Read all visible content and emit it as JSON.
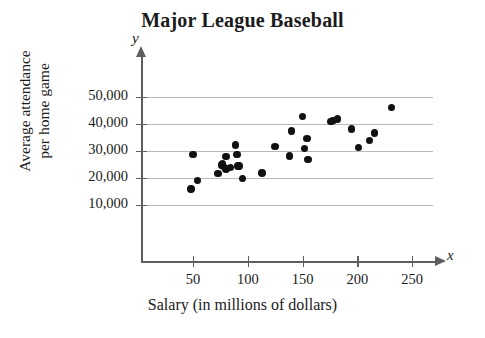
{
  "chart_data": {
    "type": "scatter",
    "title": "Major League Baseball",
    "xlabel": "Salary (in millions of dollars)",
    "ylabel": "Average attendance per home game",
    "ylabel_lines": [
      "Average attendance",
      "per home game"
    ],
    "x_axis_name": "x",
    "y_axis_name": "y",
    "xlim": [
      0,
      270
    ],
    "ylim": [
      0,
      54000
    ],
    "xticks": [
      50,
      100,
      150,
      200,
      250
    ],
    "xtick_labels": [
      "50",
      "100",
      "150",
      "200",
      "250"
    ],
    "yticks": [
      10000,
      20000,
      30000,
      40000,
      50000
    ],
    "ytick_labels": [
      "10,000",
      "20,000",
      "30,000",
      "40,000",
      "50,000"
    ],
    "grid": "horizontal",
    "legend": "none",
    "marker": "filled-circle",
    "marker_color": "#111111",
    "grid_color": "#b9b9b9",
    "axis_color": "#5e5e5e",
    "points": [
      {
        "x": 50,
        "y": 28800
      },
      {
        "x": 48,
        "y": 15900
      },
      {
        "x": 54,
        "y": 19000
      },
      {
        "x": 73,
        "y": 21600
      },
      {
        "x": 76,
        "y": 24800
      },
      {
        "x": 77,
        "y": 25200
      },
      {
        "x": 78,
        "y": 24300
      },
      {
        "x": 80,
        "y": 27900
      },
      {
        "x": 80,
        "y": 23300
      },
      {
        "x": 84,
        "y": 23900
      },
      {
        "x": 89,
        "y": 32200
      },
      {
        "x": 90,
        "y": 28700
      },
      {
        "x": 91,
        "y": 24400
      },
      {
        "x": 92,
        "y": 24400
      },
      {
        "x": 95,
        "y": 19800
      },
      {
        "x": 113,
        "y": 21800
      },
      {
        "x": 125,
        "y": 31700
      },
      {
        "x": 138,
        "y": 28200
      },
      {
        "x": 140,
        "y": 37400
      },
      {
        "x": 150,
        "y": 42700
      },
      {
        "x": 152,
        "y": 30900
      },
      {
        "x": 154,
        "y": 34600
      },
      {
        "x": 155,
        "y": 26900
      },
      {
        "x": 176,
        "y": 40900
      },
      {
        "x": 178,
        "y": 41400
      },
      {
        "x": 182,
        "y": 41800
      },
      {
        "x": 195,
        "y": 38100
      },
      {
        "x": 201,
        "y": 31400
      },
      {
        "x": 211,
        "y": 33800
      },
      {
        "x": 216,
        "y": 36700
      },
      {
        "x": 231,
        "y": 46100
      }
    ]
  }
}
